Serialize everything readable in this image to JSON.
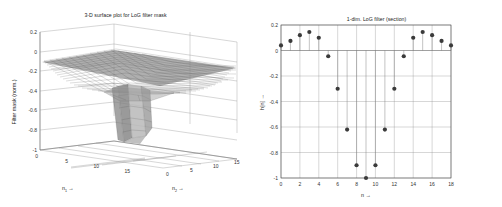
{
  "figure": {
    "background_color": "#ffffff",
    "panels": 2
  },
  "left_panel": {
    "name": "3d-surface-plot",
    "title": "3-D surface plot for LoG filter mask",
    "ylabel": "Filter mask (norm.)",
    "xlabel_1": "n",
    "xlabel_1_sub": "1",
    "xlabel_1_arrow": "→",
    "xlabel_2": "n",
    "xlabel_2_sub": "2",
    "xlabel_2_arrow": "→",
    "z_ticks": [
      "0.2",
      "0",
      "-0.2",
      "-0.4",
      "-0.6",
      "-0.8",
      "-1"
    ],
    "x_ticks": [
      "0",
      "5",
      "10",
      "15"
    ],
    "y_ticks": [
      "0",
      "5",
      "10",
      "15"
    ]
  },
  "right_panel": {
    "name": "1d-stem-plot",
    "title": "1-dim. LoG filter (section)",
    "ylabel": "h[n]",
    "ylabel_arrow": "→",
    "xlabel": "n",
    "xlabel_arrow": "→",
    "y_ticks": [
      "0.2",
      "0",
      "-0.2",
      "-0.4",
      "-0.6",
      "-0.8",
      "-1"
    ],
    "x_ticks": [
      "0",
      "2",
      "4",
      "6",
      "8",
      "10",
      "12",
      "14",
      "16",
      "18"
    ]
  },
  "chart_data": [
    {
      "type": "surface",
      "title": "3-D surface plot for LoG filter mask",
      "xlabel": "n1 →",
      "ylabel": "n2 →",
      "zlabel": "Filter mask (norm.)",
      "xlim": [
        0,
        18
      ],
      "ylim": [
        0,
        18
      ],
      "zlim": [
        -1,
        0.2
      ],
      "xticks": [
        0,
        5,
        10,
        15
      ],
      "yticks": [
        0,
        5,
        10,
        15
      ],
      "zticks": [
        0.2,
        0,
        -0.2,
        -0.4,
        -0.6,
        -0.8,
        -1
      ],
      "grid": true,
      "description": "Laplacian-of-Gaussian mesh: flat slightly-positive rim near z=0..0.1 with a deep narrow negative well reaching z=-1 at the centre.",
      "colormap": "gray",
      "center": [
        9,
        9
      ],
      "min_value": -1.0,
      "max_value": 0.145
    },
    {
      "type": "scatter",
      "subtype": "stem",
      "title": "1-dim. LoG filter (section)",
      "xlabel": "n →",
      "ylabel": "h[n] →",
      "xlim": [
        0,
        18
      ],
      "ylim": [
        -1,
        0.2
      ],
      "xticks": [
        0,
        2,
        4,
        6,
        8,
        10,
        12,
        14,
        16,
        18
      ],
      "yticks": [
        0.2,
        0,
        -0.2,
        -0.4,
        -0.6,
        -0.8,
        -1
      ],
      "grid": true,
      "legend": null,
      "x": [
        0,
        1,
        2,
        3,
        4,
        5,
        6,
        7,
        8,
        9,
        10,
        11,
        12,
        13,
        14,
        15,
        16,
        17,
        18
      ],
      "values": [
        0.04,
        0.075,
        0.12,
        0.145,
        0.1,
        -0.045,
        -0.3,
        -0.62,
        -0.9,
        -1.0,
        -0.9,
        -0.62,
        -0.3,
        -0.045,
        0.1,
        0.145,
        0.12,
        0.075,
        0.04
      ]
    }
  ]
}
